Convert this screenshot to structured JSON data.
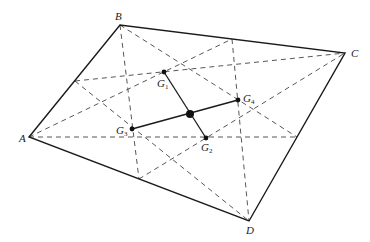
{
  "figure": {
    "vertices": {
      "A": {
        "label": "A",
        "x": 29,
        "y": 137,
        "lx": 19,
        "ly": 142
      },
      "B": {
        "label": "B",
        "x": 120,
        "y": 25,
        "lx": 115,
        "ly": 20
      },
      "C": {
        "label": "C",
        "x": 345,
        "y": 53,
        "lx": 351,
        "ly": 57
      },
      "D": {
        "label": "D",
        "x": 249,
        "y": 221,
        "lx": 246,
        "ly": 234
      }
    },
    "midpoints": {
      "AB": {
        "x": 75,
        "y": 81
      },
      "BC": {
        "x": 232,
        "y": 39
      },
      "CD": {
        "x": 297,
        "y": 137
      },
      "AD": {
        "x": 139,
        "y": 179
      }
    },
    "centroids": {
      "G1": {
        "label": "G",
        "sub": "1",
        "x": 164,
        "y": 72,
        "lx": 157,
        "ly": 87,
        "triangle": "ABC"
      },
      "G2": {
        "label": "G",
        "sub": "2",
        "x": 206,
        "y": 138,
        "lx": 201,
        "ly": 151,
        "triangle": "ACD"
      },
      "G3": {
        "label": "G",
        "sub": "3",
        "x": 132,
        "y": 129,
        "lx": 116,
        "ly": 134,
        "triangle": "ABD"
      },
      "G4": {
        "label": "G",
        "sub": "4",
        "x": 238,
        "y": 100,
        "lx": 243,
        "ly": 102,
        "triangle": "BCD"
      }
    },
    "center": {
      "x": 190,
      "y": 114
    }
  }
}
